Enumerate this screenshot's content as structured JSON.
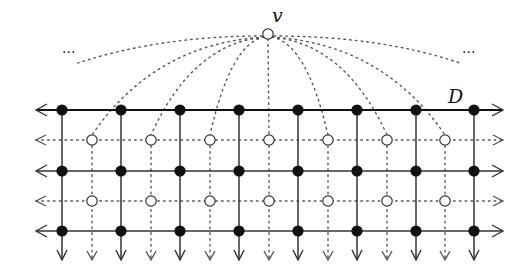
{
  "diagram": {
    "type": "grid-graph",
    "labels": {
      "apex_vertex": "v",
      "top_line": "D",
      "ellipsis_left": "...",
      "ellipsis_right": "..."
    },
    "apex": {
      "x": 268,
      "y": 34
    },
    "solid_rows_y": [
      110,
      171,
      231
    ],
    "dotted_rows_y": [
      140,
      201
    ],
    "filled_columns_x": [
      62,
      121,
      180,
      239,
      298,
      357,
      416,
      474
    ],
    "hollow_columns_x": [
      92,
      151,
      210,
      269,
      328,
      387,
      445
    ],
    "left_arrow_x": 36,
    "right_arrow_x": 503,
    "down_arrow_y": 260,
    "colors": {
      "ink": "#111111",
      "grid": "#333333",
      "dotted": "#555555",
      "background": "#ffffff"
    }
  }
}
